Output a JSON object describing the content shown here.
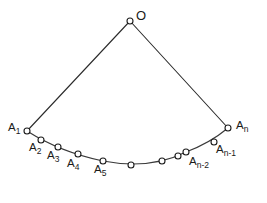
{
  "figure": {
    "background_color": "#ffffff",
    "line_color": "#2b2b2b",
    "arc_color": "#3a3a3a",
    "marker_fill": "#ffffff",
    "marker_stroke": "#1d1d1d",
    "width": 267,
    "height": 203
  },
  "apex": {
    "label": "O",
    "x": 130,
    "y": 21
  },
  "radii": [
    {
      "name": "left-radius",
      "x1": 130,
      "y1": 21,
      "x2": 27,
      "y2": 131
    },
    {
      "name": "right-radius",
      "x1": 130,
      "y1": 21,
      "x2": 228,
      "y2": 128
    }
  ],
  "arc": {
    "path": "M 27 131 Q 60 152 103 161 Q 150 170 186 152 Q 210 143 228 128",
    "description": "concave-up arc from A1 to An"
  },
  "points": [
    {
      "label": "A",
      "sub": "1",
      "x": 27,
      "y": 131,
      "label_x": 8,
      "label_y": 122,
      "labeled": true
    },
    {
      "label": "A",
      "sub": "2",
      "x": 41,
      "y": 140,
      "label_x": 29,
      "label_y": 142,
      "labeled": true
    },
    {
      "label": "A",
      "sub": "3",
      "x": 58,
      "y": 147,
      "label_x": 47,
      "label_y": 150,
      "labeled": true
    },
    {
      "label": "A",
      "sub": "4",
      "x": 78,
      "y": 154,
      "label_x": 67,
      "label_y": 158,
      "labeled": true
    },
    {
      "label": "A",
      "sub": "5",
      "x": 103,
      "y": 161,
      "label_x": 94,
      "label_y": 164,
      "labeled": true
    },
    {
      "label": "",
      "sub": "",
      "x": 131,
      "y": 165,
      "label_x": 0,
      "label_y": 0,
      "labeled": false
    },
    {
      "label": "",
      "sub": "",
      "x": 162,
      "y": 161,
      "label_x": 0,
      "label_y": 0,
      "labeled": false
    },
    {
      "label": "",
      "sub": "",
      "x": 178,
      "y": 156,
      "label_x": 0,
      "label_y": 0,
      "labeled": false
    },
    {
      "label": "A",
      "sub": "n-2",
      "x": 186,
      "y": 152,
      "label_x": 189,
      "label_y": 156,
      "labeled": true
    },
    {
      "label": "A",
      "sub": "n-1",
      "x": 214,
      "y": 142,
      "label_x": 216,
      "label_y": 144,
      "labeled": true
    },
    {
      "label": "A",
      "sub": "n",
      "x": 228,
      "y": 128,
      "label_x": 236,
      "label_y": 120,
      "labeled": true
    }
  ]
}
